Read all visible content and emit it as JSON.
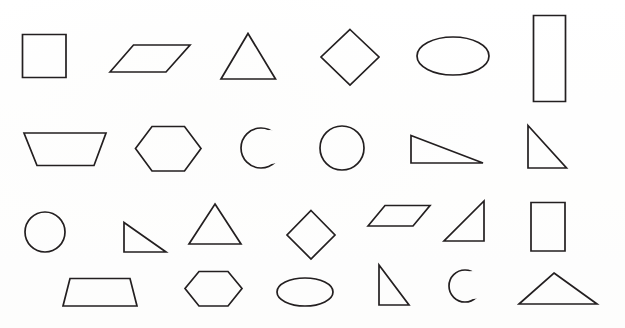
{
  "page": {
    "background_color": "#ffffff",
    "stroke_color": "#231f20",
    "width": 625,
    "height": 328,
    "row_count": 4,
    "shape_count": 24
  },
  "rows": [
    {
      "index": 1,
      "shapes": [
        {
          "name": "square",
          "label": "Square"
        },
        {
          "name": "parallelogram",
          "label": "Parallelogram"
        },
        {
          "name": "triangle",
          "label": "Triangle"
        },
        {
          "name": "diamond",
          "label": "Diamond"
        },
        {
          "name": "ellipse",
          "label": "Ellipse"
        },
        {
          "name": "rectangle",
          "label": "Rectangle"
        }
      ]
    },
    {
      "index": 2,
      "shapes": [
        {
          "name": "trapezoid",
          "label": "Trapezoid"
        },
        {
          "name": "hexagon",
          "label": "Hexagon"
        },
        {
          "name": "crescent",
          "label": "Crescent"
        },
        {
          "name": "circle",
          "label": "Circle"
        },
        {
          "name": "right-triangle",
          "label": "Right Triangle"
        },
        {
          "name": "right-triangle",
          "label": "Right Triangle"
        }
      ]
    },
    {
      "index": 3,
      "shapes": [
        {
          "name": "circle",
          "label": "Circle"
        },
        {
          "name": "right-triangle",
          "label": "Right Triangle"
        },
        {
          "name": "triangle",
          "label": "Triangle"
        },
        {
          "name": "diamond",
          "label": "Diamond"
        },
        {
          "name": "parallelogram",
          "label": "Parallelogram"
        },
        {
          "name": "right-triangle",
          "label": "Right Triangle"
        },
        {
          "name": "rectangle",
          "label": "Rectangle"
        }
      ]
    },
    {
      "index": 4,
      "shapes": [
        {
          "name": "trapezoid",
          "label": "Trapezoid"
        },
        {
          "name": "hexagon",
          "label": "Hexagon"
        },
        {
          "name": "ellipse",
          "label": "Ellipse"
        },
        {
          "name": "right-triangle",
          "label": "Right Triangle"
        },
        {
          "name": "crescent",
          "label": "Crescent"
        },
        {
          "name": "obtuse-triangle",
          "label": "Obtuse Triangle"
        }
      ]
    }
  ],
  "shape_geometry": {
    "row1": {
      "square": "M22.5,34.5 L66,34.5 L66,77.5 L22.5,77.5 Z",
      "parallelogram": "M110,72 L133.5,45 L190,45 L166,72 Z",
      "triangle": "M248,33.5 L275.5,79 L221,79 Z",
      "diamond": "M350,29.5 L379,57 L350,85 L321,57 Z",
      "ellipse": {
        "cx": 453,
        "cy": 56,
        "rx": 36,
        "ry": 19
      },
      "rectangle": "M533.5,15.5 L565.5,15.5 L565.5,101.5 L533.5,101.5 Z"
    },
    "row2": {
      "trapezoid": "M24,133 L106,133 L94,165.5 L37,165.5 Z",
      "hexagon": "M152,126.5 L184.5,126.5 L201,148.5 L184.5,171 L152,171 L135.5,148.5 Z",
      "crescent_outer": {
        "cx": 261,
        "cy": 148,
        "r": 20
      },
      "crescent_inner": {
        "cx": 270,
        "cy": 147,
        "r": 17
      },
      "circle": {
        "cx": 342,
        "cy": 148,
        "r": 22
      },
      "right_triangle_a": "M411,135.5 L483,163 L411,163 Z",
      "right_triangle_b": "M528,125.5 L566.5,168 L528,168 Z"
    },
    "row3": {
      "circle": {
        "cx": 45,
        "cy": 232,
        "r": 20
      },
      "right_triangle": "M124,222.5 L166,252 L124,252 Z",
      "triangle": "M215,204 L241,244 L189,244 Z",
      "diamond": "M311,210.5 L335,235 L311,259 L287,235 Z",
      "parallelogram": "M368,226 L385,205.5 L430,205.5 L413,226 Z",
      "right_triangle_b": "M484,201 L484,241 L444,241 Z",
      "rectangle": "M531,202.5 L565,202.5 L565,251 L531,251 Z"
    },
    "row4": {
      "trapezoid": "M70,278.5 L130,278.5 L137,306 L63,306 Z",
      "hexagon": "M199,271.5 L228,271.5 L242,288.5 L228,306 L199,306 L185,288.5 Z",
      "ellipse": {
        "cx": 305,
        "cy": 292,
        "rx": 28,
        "ry": 14
      },
      "right_triangle": "M379,265 L409,305 L379,305 Z",
      "crescent_outer": {
        "cx": 465,
        "cy": 286,
        "r": 16
      },
      "crescent_inner": {
        "cx": 473,
        "cy": 285,
        "r": 14
      },
      "obtuse_triangle": "M554,273 L597,304 L519,304 Z"
    }
  }
}
